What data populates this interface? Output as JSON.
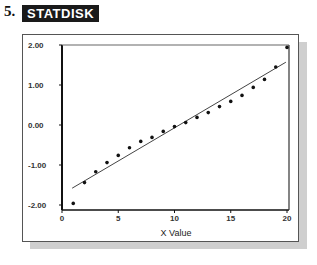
{
  "header": {
    "problem_number": "5.",
    "software_badge": "STATDISK"
  },
  "colors": {
    "badge_bg": "#1a1a1a",
    "badge_text": "#ffffff",
    "points": "#111111",
    "line": "#444444",
    "shadow": "#cfcfcf"
  },
  "chart_data": {
    "type": "scatter",
    "title": "",
    "xlabel": "X Value",
    "ylabel": "",
    "xlim": [
      0,
      20
    ],
    "ylim": [
      -2,
      2
    ],
    "x_ticks": [
      0,
      5,
      10,
      15,
      20
    ],
    "x_tick_labels": [
      "0",
      "5",
      "10",
      "15",
      "20"
    ],
    "y_ticks": [
      2,
      1,
      0,
      -1,
      -2
    ],
    "y_tick_labels": [
      "2.00",
      "1.00",
      "0.00",
      "-1.00",
      "-2.00"
    ],
    "grid": false,
    "legend": null,
    "series": [
      {
        "name": "data",
        "kind": "points",
        "x": [
          1,
          2,
          3,
          4,
          5,
          6,
          7,
          8,
          9,
          10,
          11,
          12,
          13,
          14,
          15,
          16,
          17,
          18,
          19,
          20
        ],
        "y": [
          -1.96,
          -1.44,
          -1.17,
          -0.94,
          -0.76,
          -0.57,
          -0.41,
          -0.31,
          -0.16,
          -0.04,
          0.06,
          0.19,
          0.31,
          0.46,
          0.59,
          0.74,
          0.94,
          1.14,
          1.45,
          1.94
        ]
      },
      {
        "name": "regression line",
        "kind": "line",
        "x": [
          0.9,
          19.9
        ],
        "y": [
          -1.58,
          1.57
        ]
      }
    ]
  }
}
